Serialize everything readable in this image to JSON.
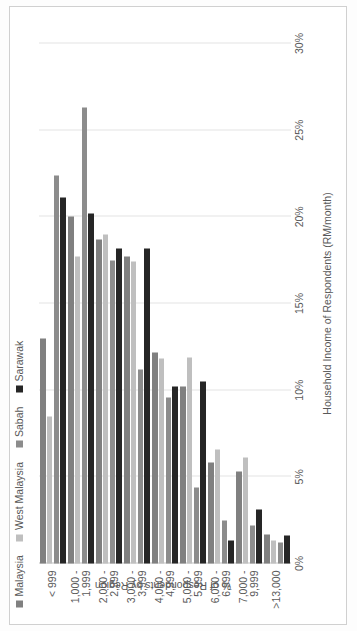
{
  "chart_data": {
    "type": "bar",
    "orientation": "horizontal",
    "title": "",
    "xlabel": "Household Income of Respondents (RM/month)",
    "ylabel": "% of Respondents by Region",
    "categories": [
      [
        "< 999"
      ],
      [
        "1,000 -",
        "1,999"
      ],
      [
        "2,000 -",
        "2,999"
      ],
      [
        "3,000 -",
        "3,999"
      ],
      [
        "4,000 -",
        "4,999"
      ],
      [
        "5,000 -",
        "5,999"
      ],
      [
        "6,000 -",
        "6,999"
      ],
      [
        "7,000 -",
        "9,999"
      ],
      [
        ">13,000"
      ]
    ],
    "series": [
      {
        "name": "Malaysia",
        "color": "#808080",
        "values": [
          13.0,
          20.0,
          18.7,
          17.7,
          12.2,
          10.2,
          5.8,
          5.3,
          1.7
        ]
      },
      {
        "name": "West Malaysia",
        "color": "#bfbfbf",
        "values": [
          8.5,
          17.7,
          19.0,
          17.4,
          11.8,
          11.9,
          6.6,
          6.1,
          1.3
        ]
      },
      {
        "name": "Sabah",
        "color": "#8c8c8c",
        "values": [
          22.4,
          26.3,
          17.5,
          11.2,
          9.6,
          4.4,
          2.5,
          2.2,
          1.2
        ]
      },
      {
        "name": "Sarawak",
        "color": "#262626",
        "values": [
          21.1,
          20.2,
          18.2,
          18.2,
          10.2,
          10.5,
          1.3,
          3.1,
          1.6
        ]
      }
    ],
    "x_ticks": [
      "0%",
      "5%",
      "10%",
      "15%",
      "20%",
      "25%",
      "30%"
    ],
    "x_tick_values": [
      0,
      5,
      10,
      15,
      20,
      25,
      30
    ],
    "xlim": [
      0,
      30
    ],
    "grid": true,
    "legend_position": "top-left"
  }
}
